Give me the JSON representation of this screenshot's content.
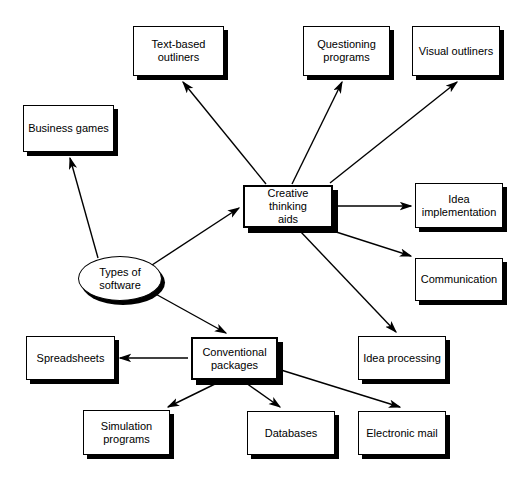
{
  "diagram": {
    "title": "Types of software",
    "type": "node-link concept map",
    "canvas": {
      "width": 525,
      "height": 482
    },
    "style": {
      "background": "#ffffff",
      "node_fill": "#ffffff",
      "node_stroke": "#000000",
      "shadow": "#000000",
      "edge_color": "#000000",
      "text_color": "#000000"
    },
    "nodes": [
      {
        "id": "types-of-software",
        "label": "Types of\nsoftware",
        "shape": "ellipse",
        "emphasis": false,
        "x": 78,
        "y": 256,
        "w": 84,
        "h": 45
      },
      {
        "id": "business-games",
        "label": "Business games",
        "shape": "rect",
        "emphasis": false,
        "x": 23,
        "y": 105,
        "w": 91,
        "h": 47
      },
      {
        "id": "creative-thinking-aids",
        "label": "Creative thinking\naids",
        "shape": "rect",
        "emphasis": true,
        "x": 243,
        "y": 185,
        "w": 90,
        "h": 43
      },
      {
        "id": "conventional-packages",
        "label": "Conventional\npackages",
        "shape": "rect",
        "emphasis": true,
        "x": 191,
        "y": 337,
        "w": 87,
        "h": 43
      },
      {
        "id": "text-based-outliners",
        "label": "Text-based\noutliners",
        "shape": "rect",
        "emphasis": false,
        "x": 133,
        "y": 26,
        "w": 91,
        "h": 50
      },
      {
        "id": "questioning-programs",
        "label": "Questioning\nprograms",
        "shape": "rect",
        "emphasis": false,
        "x": 303,
        "y": 26,
        "w": 87,
        "h": 50
      },
      {
        "id": "visual-outliners",
        "label": "Visual outliners",
        "shape": "rect",
        "emphasis": false,
        "x": 412,
        "y": 26,
        "w": 88,
        "h": 50
      },
      {
        "id": "idea-implementation",
        "label": "Idea\nimplementation",
        "shape": "rect",
        "emphasis": false,
        "x": 415,
        "y": 183,
        "w": 88,
        "h": 45
      },
      {
        "id": "communication",
        "label": "Communication",
        "shape": "rect",
        "emphasis": false,
        "x": 415,
        "y": 258,
        "w": 88,
        "h": 43
      },
      {
        "id": "idea-processing",
        "label": "Idea processing",
        "shape": "rect",
        "emphasis": false,
        "x": 358,
        "y": 336,
        "w": 88,
        "h": 44
      },
      {
        "id": "spreadsheets",
        "label": "Spreadsheets",
        "shape": "rect",
        "emphasis": false,
        "x": 26,
        "y": 336,
        "w": 89,
        "h": 44
      },
      {
        "id": "simulation-programs",
        "label": "Simulation\nprograms",
        "shape": "rect",
        "emphasis": false,
        "x": 83,
        "y": 410,
        "w": 87,
        "h": 45
      },
      {
        "id": "databases",
        "label": "Databases",
        "shape": "rect",
        "emphasis": false,
        "x": 247,
        "y": 411,
        "w": 88,
        "h": 44
      },
      {
        "id": "electronic-mail",
        "label": "Electronic mail",
        "shape": "rect",
        "emphasis": false,
        "x": 358,
        "y": 411,
        "w": 88,
        "h": 44
      }
    ],
    "edges": [
      {
        "from": "types-of-software",
        "to": "business-games",
        "x1": 98,
        "y1": 258,
        "x2": 70,
        "y2": 158
      },
      {
        "from": "types-of-software",
        "to": "creative-thinking-aids",
        "x1": 152,
        "y1": 265,
        "x2": 239,
        "y2": 208
      },
      {
        "from": "types-of-software",
        "to": "conventional-packages",
        "x1": 152,
        "y1": 292,
        "x2": 226,
        "y2": 333
      },
      {
        "from": "creative-thinking-aids",
        "to": "text-based-outliners",
        "x1": 266,
        "y1": 184,
        "x2": 183,
        "y2": 82
      },
      {
        "from": "creative-thinking-aids",
        "to": "questioning-programs",
        "x1": 292,
        "y1": 184,
        "x2": 342,
        "y2": 82
      },
      {
        "from": "creative-thinking-aids",
        "to": "visual-outliners",
        "x1": 330,
        "y1": 183,
        "x2": 457,
        "y2": 82
      },
      {
        "from": "creative-thinking-aids",
        "to": "idea-implementation",
        "x1": 337,
        "y1": 206,
        "x2": 411,
        "y2": 206
      },
      {
        "from": "creative-thinking-aids",
        "to": "communication",
        "x1": 330,
        "y1": 230,
        "x2": 411,
        "y2": 256
      },
      {
        "from": "creative-thinking-aids",
        "to": "idea-processing",
        "x1": 300,
        "y1": 231,
        "x2": 396,
        "y2": 332
      },
      {
        "from": "conventional-packages",
        "to": "spreadsheets",
        "x1": 188,
        "y1": 358,
        "x2": 120,
        "y2": 358
      },
      {
        "from": "conventional-packages",
        "to": "simulation-programs",
        "x1": 217,
        "y1": 383,
        "x2": 168,
        "y2": 407
      },
      {
        "from": "conventional-packages",
        "to": "databases",
        "x1": 246,
        "y1": 383,
        "x2": 280,
        "y2": 407
      },
      {
        "from": "conventional-packages",
        "to": "electronic-mail",
        "x1": 281,
        "y1": 370,
        "x2": 400,
        "y2": 407
      }
    ]
  }
}
